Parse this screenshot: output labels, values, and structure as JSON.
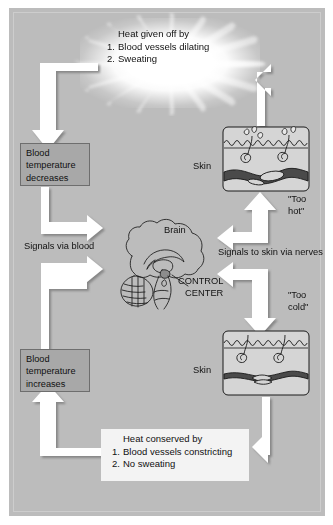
{
  "figure": {
    "background_color": "#bcbcbc",
    "arrow_color": "#ffffff",
    "box_color": "#a8a8a8",
    "glow_color": "#ffffff"
  },
  "heat_loss_box": {
    "heading": "Heat given off by",
    "items": [
      {
        "num": "1.",
        "text": "Blood vessels dilating"
      },
      {
        "num": "2.",
        "text": "Sweating"
      }
    ]
  },
  "heat_conserve_box": {
    "heading": "Heat conserved by",
    "items": [
      {
        "num": "1.",
        "text": "Blood vessels constricting"
      },
      {
        "num": "2.",
        "text": "No sweating"
      }
    ]
  },
  "temperature_boxes": {
    "decrease": "Blood temperature decreases",
    "increase": "Blood temperature increases"
  },
  "labels": {
    "signals_via_blood": "Signals via blood",
    "signals_to_skin": "Signals to skin via nerves",
    "brain": "Brain",
    "control_center_line1": "CONTROL",
    "control_center_line2": "CENTER",
    "skin_top": "Skin",
    "skin_bottom": "Skin",
    "too_hot_line1": "\"Too",
    "too_hot_line2": "hot\"",
    "too_cold_line1": "\"Too",
    "too_cold_line2": "cold\""
  },
  "icons": {
    "glow": "starburst-icon",
    "brain": "brain-sagittal-icon",
    "skin_hot": "skin-dilated-sweating-icon",
    "skin_cold": "skin-constricted-icon",
    "arrows": "flow-arrow-icon"
  }
}
